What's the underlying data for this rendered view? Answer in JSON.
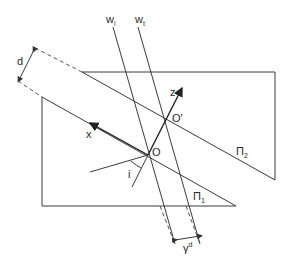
{
  "figure": {
    "labels": {
      "d": "d",
      "w_i": "w",
      "w_i_sub": "i",
      "w_t": "w",
      "w_t_sub": "t",
      "z": "z",
      "x": "x",
      "O": "O",
      "O_prime": "O'",
      "i": "i",
      "pi_1": "Π",
      "pi_1_sub": "1",
      "pi_2": "Π",
      "pi_2_sub": "2",
      "gamma_d": "γ",
      "gamma_d_sup": "d"
    },
    "colors": {
      "line": "#3a3a3a",
      "background": "#ffffff"
    }
  }
}
